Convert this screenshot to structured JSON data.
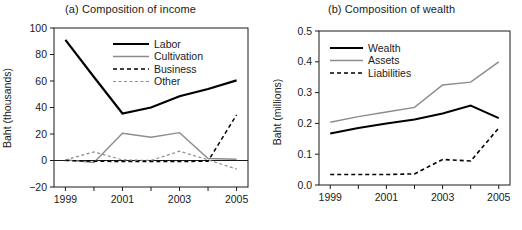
{
  "figure": {
    "width": 522,
    "height": 230,
    "background": "#ffffff"
  },
  "chart_data": [
    {
      "type": "line",
      "panel_id": "a",
      "title": "(a) Composition of income",
      "xlabel": "",
      "ylabel": "Baht (thousands)",
      "x": [
        1999,
        2000,
        2001,
        2002,
        2003,
        2004,
        2005
      ],
      "xlim": [
        1998.6,
        2005.4
      ],
      "ylim": [
        -20,
        100
      ],
      "xticks": [
        1999,
        2000,
        2001,
        2002,
        2003,
        2004,
        2005
      ],
      "xticklabels": [
        "1999",
        "",
        "2001",
        "",
        "2003",
        "",
        "2005"
      ],
      "yticks": [
        -20,
        0,
        20,
        40,
        60,
        80,
        100
      ],
      "yticklabels": [
        "−20",
        "0",
        "20",
        "40",
        "60",
        "80",
        "100"
      ],
      "grid": false,
      "legend_position": "upper center",
      "zero_line": 0,
      "series": [
        {
          "name": "Labor",
          "values": [
            91,
            63,
            35.5,
            40,
            48.5,
            54,
            60.5
          ],
          "color": "#000000",
          "width": 2.2,
          "dash": "none"
        },
        {
          "name": "Cultivation",
          "values": [
            0.5,
            -1.5,
            20.5,
            17.5,
            21,
            1.5,
            1
          ],
          "color": "#8c8c8c",
          "width": 1.4,
          "dash": "none"
        },
        {
          "name": "Business",
          "values": [
            0,
            -0.5,
            -0.8,
            -0.8,
            -0.8,
            -0.5,
            34.5
          ],
          "color": "#000000",
          "width": 1.5,
          "dash": "4,3"
        },
        {
          "name": "Other",
          "values": [
            0.5,
            6.5,
            0.5,
            0,
            7,
            0.5,
            -6.5
          ],
          "color": "#8c8c8c",
          "width": 1.2,
          "dash": "3,2.5"
        }
      ]
    },
    {
      "type": "line",
      "panel_id": "b",
      "title": "(b) Composition of wealth",
      "xlabel": "",
      "ylabel": "Baht (millions)",
      "x": [
        1999,
        2000,
        2001,
        2002,
        2003,
        2004,
        2005
      ],
      "xlim": [
        1998.6,
        2005.4
      ],
      "ylim": [
        0.0,
        0.5
      ],
      "xticks": [
        1999,
        2000,
        2001,
        2002,
        2003,
        2004,
        2005
      ],
      "xticklabels": [
        "1999",
        "",
        "2001",
        "",
        "2003",
        "",
        "2005"
      ],
      "yticks": [
        0.0,
        0.1,
        0.2,
        0.3,
        0.4,
        0.5
      ],
      "yticklabels": [
        "0.0",
        "0.1",
        "0.2",
        "0.3",
        "0.4",
        "0.5"
      ],
      "grid": false,
      "legend_position": "upper left",
      "zero_line": null,
      "series": [
        {
          "name": "Wealth",
          "values": [
            0.167,
            0.185,
            0.2,
            0.213,
            0.232,
            0.258,
            0.217
          ],
          "color": "#000000",
          "width": 2.0,
          "dash": "none"
        },
        {
          "name": "Assets",
          "values": [
            0.204,
            0.222,
            0.237,
            0.252,
            0.325,
            0.334,
            0.4
          ],
          "color": "#8c8c8c",
          "width": 1.5,
          "dash": "none"
        },
        {
          "name": "Liabilities",
          "values": [
            0.034,
            0.034,
            0.034,
            0.036,
            0.083,
            0.078,
            0.185
          ],
          "color": "#000000",
          "width": 1.6,
          "dash": "4,3"
        }
      ]
    }
  ]
}
